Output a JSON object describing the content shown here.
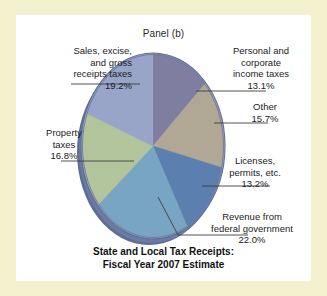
{
  "panel": {
    "label": "Panel (b)"
  },
  "chart_title": {
    "line1": "State and Local Tax Receipts:",
    "line2": "Fiscal Year 2007 Estimate"
  },
  "callouts": {
    "sales": {
      "l1": "Sales, excise,",
      "l2": "and gross",
      "l3": "receipts taxes",
      "pct": "19.2%"
    },
    "property": {
      "l1": "Property",
      "l2": "taxes",
      "pct": "16.8%"
    },
    "personal": {
      "l1": "Personal and",
      "l2": "corporate",
      "l3": "income taxes",
      "pct": "13.1%"
    },
    "other": {
      "l1": "Other",
      "pct": "15.7%"
    },
    "licenses": {
      "l1": "Licenses,",
      "l2": "permits, etc.",
      "pct": "13.2%"
    },
    "revenue": {
      "l1": "Revenue from",
      "l2": "federal government",
      "pct": "22.0%"
    }
  },
  "colors": {
    "background": "#f5f1cf",
    "panel": "#ffffff",
    "rim": "#67769f",
    "rim_light": "#8b99bc",
    "leader": "#4a4a4a",
    "sales": "#98a5c9",
    "property": "#b2c49c",
    "personal": "#7f7da0",
    "other": "#b0a794",
    "licenses": "#5b7fae",
    "revenue": "#78a5c1"
  },
  "chart_data": {
    "type": "pie",
    "title": "State and Local Tax Receipts: Fiscal Year 2007 Estimate",
    "subtitle": "Panel (b)",
    "xlabel": "",
    "ylabel": "",
    "units": "percent",
    "total": 100.0,
    "legend_position": "callouts",
    "grid": false,
    "start_angle_deg": 0,
    "direction": "clockwise",
    "labels": [
      "Personal and corporate income taxes",
      "Other",
      "Licenses, permits, etc.",
      "Revenue from federal government",
      "Property taxes",
      "Sales, excise, and gross receipts taxes"
    ],
    "values": [
      13.1,
      15.7,
      13.2,
      22.0,
      16.8,
      19.2
    ],
    "slice_colors": [
      "#7f7da0",
      "#b0a794",
      "#5b7fae",
      "#78a5c1",
      "#b2c49c",
      "#98a5c9"
    ],
    "slices": [
      {
        "label": "Personal and corporate income taxes",
        "value": 13.1,
        "color": "#7f7da0"
      },
      {
        "label": "Other",
        "value": 15.7,
        "color": "#b0a794"
      },
      {
        "label": "Licenses, permits, etc.",
        "value": 13.2,
        "color": "#5b7fae"
      },
      {
        "label": "Revenue from federal government",
        "value": 22.0,
        "color": "#78a5c1"
      },
      {
        "label": "Property taxes",
        "value": 16.8,
        "color": "#b2c49c"
      },
      {
        "label": "Sales, excise, and gross receipts taxes",
        "value": 19.2,
        "color": "#98a5c9"
      }
    ]
  }
}
